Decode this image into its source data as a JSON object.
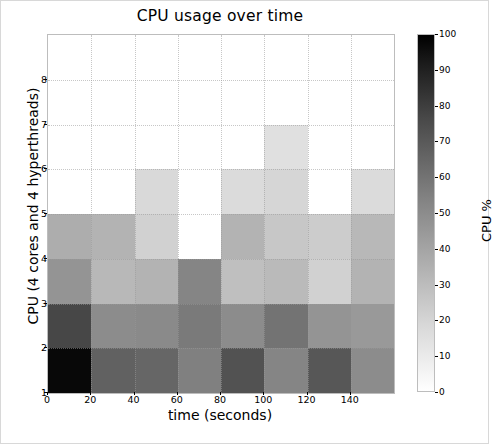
{
  "chart_data": {
    "type": "heatmap",
    "title": "CPU usage over time",
    "xlabel": "time (seconds)",
    "ylabel": "CPU (4 cores and 4 hyperthreads)",
    "colorbar_label": "CPU %",
    "colormap": "gray_r",
    "grid": true,
    "xlim": [
      0,
      160
    ],
    "ylim": [
      1,
      9
    ],
    "zlim": [
      0,
      100
    ],
    "xticks": [
      0,
      20,
      40,
      60,
      80,
      100,
      120,
      140
    ],
    "xtick_labels": [
      "0",
      "20",
      "40",
      "60",
      "80",
      "100",
      "120",
      "140"
    ],
    "yticks": [
      1,
      2,
      3,
      4,
      5,
      6,
      7,
      8
    ],
    "ytick_labels": [
      "1",
      "2",
      "3",
      "4",
      "5",
      "6",
      "7",
      "8"
    ],
    "colorbar_ticks": [
      0,
      10,
      20,
      30,
      40,
      50,
      60,
      70,
      80,
      90,
      100
    ],
    "colorbar_tick_labels": [
      "0",
      "10",
      "20",
      "30",
      "40",
      "50",
      "60",
      "70",
      "80",
      "90",
      "100"
    ],
    "x_bin_edges": [
      0,
      20,
      40,
      60,
      80,
      100,
      120,
      140,
      160
    ],
    "x_bin_centers": [
      10,
      30,
      50,
      70,
      90,
      110,
      130,
      150
    ],
    "row_labels": [
      "1",
      "2",
      "3",
      "4",
      "5",
      "6",
      "7",
      "8"
    ],
    "column_labels": [
      "0-20",
      "20-40",
      "40-60",
      "60-80",
      "80-100",
      "100-120",
      "120-140",
      "140-160"
    ],
    "values": [
      [
        97,
        62,
        60,
        50,
        68,
        48,
        66,
        45
      ],
      [
        72,
        45,
        46,
        52,
        45,
        55,
        42,
        40
      ],
      [
        42,
        28,
        30,
        48,
        25,
        27,
        18,
        30
      ],
      [
        32,
        30,
        18,
        0,
        30,
        22,
        20,
        28
      ],
      [
        0,
        0,
        15,
        0,
        14,
        16,
        0,
        14
      ],
      [
        0,
        0,
        0,
        0,
        0,
        12,
        0,
        0
      ],
      [
        0,
        0,
        0,
        0,
        0,
        0,
        0,
        0
      ],
      [
        0,
        0,
        0,
        0,
        0,
        0,
        0,
        0
      ]
    ]
  }
}
